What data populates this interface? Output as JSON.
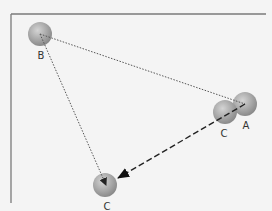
{
  "diagram": {
    "title": "",
    "frame": {
      "color": "#7a7a7a"
    },
    "nodes": [
      {
        "id": "B",
        "label": "B",
        "x": 40,
        "y": 34,
        "r": 12,
        "label_x": 41,
        "label_y": 51
      },
      {
        "id": "A",
        "label": "A",
        "x": 245,
        "y": 104,
        "r": 12,
        "label_x": 246,
        "label_y": 121
      },
      {
        "id": "C1",
        "label": "C",
        "x": 225,
        "y": 112,
        "r": 12,
        "label_x": 224,
        "label_y": 129
      },
      {
        "id": "C2",
        "label": "C",
        "x": 105,
        "y": 185,
        "r": 12,
        "label_x": 107,
        "label_y": 202
      }
    ],
    "edges": [
      {
        "from": "B",
        "to": "A",
        "style": "dotted",
        "arrow": false
      },
      {
        "from": "B",
        "to": "C2",
        "style": "dotted",
        "arrow": true
      },
      {
        "from": "A",
        "to": "C2",
        "style": "dashed",
        "arrow": true
      }
    ],
    "colors": {
      "sphere_light": "#c8c8c8",
      "sphere_dark": "#8a8a8a",
      "line": "#444444",
      "background": "#f4f4f4"
    }
  }
}
